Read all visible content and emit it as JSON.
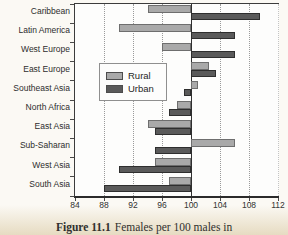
{
  "figure": {
    "caption_label": "Figure 11.1",
    "caption_text": "Females per 100 males in"
  },
  "chart_data": {
    "type": "bar",
    "orientation": "horizontal",
    "caption": "Figure 11.1 Females per 100 males in",
    "categories": [
      "Caribbean",
      "Latin America",
      "West Europe",
      "East Europe",
      "Southeast Asia",
      "North Africa",
      "East Asia",
      "Sub-Saharan",
      "West Asia",
      "South Asia"
    ],
    "series": [
      {
        "name": "Rural",
        "color": "#a9a9a9",
        "border_color": "#6e6e6e",
        "values": [
          94,
          90,
          96,
          102.5,
          101,
          98,
          94,
          106,
          95,
          97
        ]
      },
      {
        "name": "Urban",
        "color": "#5a5a5a",
        "border_color": "#2e2e2e",
        "values": [
          109.5,
          106,
          106,
          103.5,
          99,
          97,
          95,
          95,
          90,
          88
        ]
      }
    ],
    "baseline": 100,
    "xlim": [
      84,
      112
    ],
    "xticks": [
      84,
      88,
      92,
      96,
      100,
      104,
      108,
      112
    ],
    "grid": "vertical-dotted",
    "legend_position": "inside-center-left",
    "colors": {
      "axis": "#3c3c3c",
      "gridline": "#9a9a9a",
      "plot_background": "#fdfdfc",
      "page_tint": "#e4d8bc"
    }
  }
}
